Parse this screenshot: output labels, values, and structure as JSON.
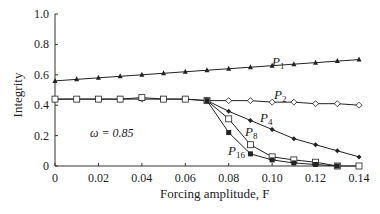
{
  "chart_data": {
    "type": "line",
    "title": "",
    "xlabel": "Forcing amplitude, F",
    "ylabel": "Integrity",
    "xlim": [
      0,
      0.14
    ],
    "ylim": [
      0,
      1.0
    ],
    "xticks": [
      "0",
      "0.02",
      "0.04",
      "0.06",
      "0.08",
      "0.10",
      "0.12",
      "0.14"
    ],
    "yticks": [
      "0",
      "0.2",
      "0.4",
      "0.6",
      "0.8",
      "1.0"
    ],
    "grid": false,
    "annotation": "ω = 0.85",
    "series": [
      {
        "name": "P1",
        "marker": "triangle-filled",
        "x": [
          0,
          0.01,
          0.02,
          0.03,
          0.04,
          0.05,
          0.06,
          0.07,
          0.08,
          0.09,
          0.1,
          0.11,
          0.12,
          0.13,
          0.14
        ],
        "y": [
          0.56,
          0.57,
          0.58,
          0.59,
          0.6,
          0.61,
          0.62,
          0.63,
          0.64,
          0.65,
          0.66,
          0.67,
          0.68,
          0.69,
          0.7
        ]
      },
      {
        "name": "P2",
        "marker": "diamond-open",
        "x": [
          0,
          0.01,
          0.02,
          0.03,
          0.04,
          0.05,
          0.06,
          0.07,
          0.08,
          0.09,
          0.1,
          0.11,
          0.12,
          0.13,
          0.14
        ],
        "y": [
          0.44,
          0.44,
          0.44,
          0.44,
          0.44,
          0.44,
          0.44,
          0.43,
          0.43,
          0.43,
          0.42,
          0.42,
          0.41,
          0.41,
          0.4
        ]
      },
      {
        "name": "P4",
        "marker": "diamond-filled",
        "x": [
          0.07,
          0.08,
          0.09,
          0.1,
          0.11,
          0.12,
          0.13,
          0.14
        ],
        "y": [
          0.43,
          0.36,
          0.3,
          0.24,
          0.18,
          0.14,
          0.1,
          0.06
        ]
      },
      {
        "name": "P8",
        "marker": "square-open",
        "x": [
          0,
          0.01,
          0.02,
          0.03,
          0.04,
          0.05,
          0.06,
          0.07,
          0.08,
          0.09,
          0.1,
          0.11,
          0.12,
          0.13,
          0.14
        ],
        "y": [
          0.44,
          0.44,
          0.44,
          0.44,
          0.45,
          0.44,
          0.44,
          0.43,
          0.31,
          0.14,
          0.06,
          0.04,
          0.025,
          0,
          0
        ]
      },
      {
        "name": "P16",
        "marker": "square-filled",
        "x": [
          0.07,
          0.08,
          0.09,
          0.1,
          0.11,
          0.12,
          0.13
        ],
        "y": [
          0.43,
          0.22,
          0.08,
          0.04,
          0.02,
          0.01,
          0
        ]
      }
    ]
  }
}
